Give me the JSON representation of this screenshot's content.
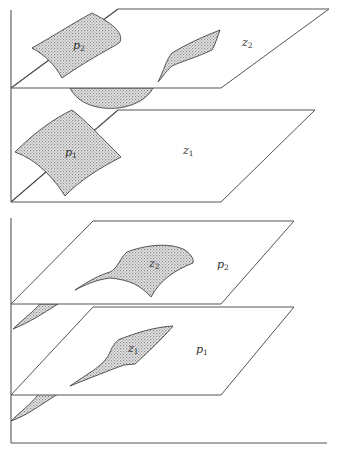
{
  "figure": {
    "panels": [
      {
        "id": "top",
        "description": "Two horizontal planes (z2 above, z1 below) with curved shaded surfaces p2 and p1 crossing them",
        "planes": [
          {
            "name": "upper-plane",
            "label": "z",
            "subscript": "2"
          },
          {
            "name": "lower-plane",
            "label": "z",
            "subscript": "1"
          }
        ],
        "surfaces": [
          {
            "name": "surface-p2",
            "label": "p",
            "subscript": "2"
          },
          {
            "name": "surface-p1",
            "label": "p",
            "subscript": "1"
          }
        ]
      },
      {
        "id": "bottom",
        "description": "Two horizontal planes (p2 above, p1 below) with curved shaded surfaces z2 and z1 lying on them",
        "planes": [
          {
            "name": "upper-plane",
            "label": "p",
            "subscript": "2"
          },
          {
            "name": "lower-plane",
            "label": "p",
            "subscript": "1"
          }
        ],
        "surfaces": [
          {
            "name": "surface-z2",
            "label": "z",
            "subscript": "2"
          },
          {
            "name": "surface-z1",
            "label": "z",
            "subscript": "1"
          }
        ]
      }
    ],
    "colors": {
      "line": "#555555",
      "patch_dot": "#8a8a8a",
      "background": "#ffffff"
    }
  }
}
